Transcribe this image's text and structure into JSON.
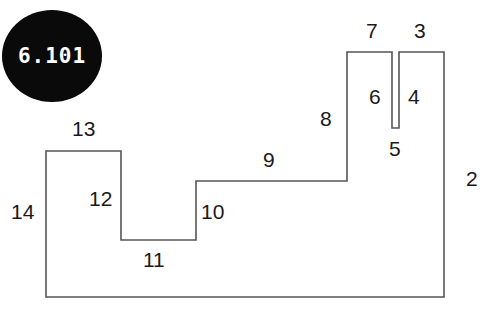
{
  "badge": {
    "label": "6.101",
    "shape": "ellipse",
    "fill": "#0a0a0a",
    "text_color": "#ffffff",
    "cx": 52,
    "cy": 56,
    "rx": 50,
    "ry": 46
  },
  "figure": {
    "name": "rectilinear-polygon",
    "stroke_color": "#555555",
    "fill_color": "#ffffff",
    "stroke_width": 1.6,
    "vertices": [
      [
        46,
        151
      ],
      [
        121,
        151
      ],
      [
        121,
        240
      ],
      [
        196,
        240
      ],
      [
        196,
        181
      ],
      [
        347,
        181
      ],
      [
        347,
        52
      ],
      [
        392,
        52
      ],
      [
        392,
        128
      ],
      [
        399,
        128
      ],
      [
        399,
        52
      ],
      [
        444,
        52
      ],
      [
        444,
        297
      ],
      [
        46,
        297
      ]
    ]
  },
  "labels": [
    {
      "id": "label-2",
      "text": "2",
      "x": 466,
      "y": 168
    },
    {
      "id": "label-3",
      "text": "3",
      "x": 414,
      "y": 20
    },
    {
      "id": "label-4",
      "text": "4",
      "x": 408,
      "y": 86
    },
    {
      "id": "label-5",
      "text": "5",
      "x": 389,
      "y": 138
    },
    {
      "id": "label-6",
      "text": "6",
      "x": 369,
      "y": 86
    },
    {
      "id": "label-7",
      "text": "7",
      "x": 366,
      "y": 20
    },
    {
      "id": "label-8",
      "text": "8",
      "x": 320,
      "y": 108
    },
    {
      "id": "label-9",
      "text": "9",
      "x": 263,
      "y": 149
    },
    {
      "id": "label-10",
      "text": "10",
      "x": 201,
      "y": 201
    },
    {
      "id": "label-11",
      "text": "11",
      "x": 143,
      "y": 249
    },
    {
      "id": "label-12",
      "text": "12",
      "x": 89,
      "y": 188
    },
    {
      "id": "label-13",
      "text": "13",
      "x": 72,
      "y": 118
    },
    {
      "id": "label-14",
      "text": "14",
      "x": 11,
      "y": 201
    }
  ]
}
